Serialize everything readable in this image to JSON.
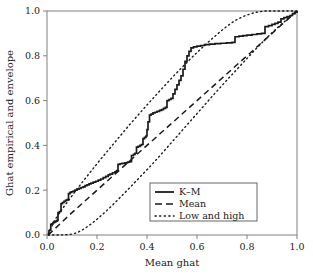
{
  "chart_data": {
    "type": "line",
    "title": "",
    "xlabel": "Mean ghat",
    "ylabel": "Ghat empirical and envelope",
    "xlim": [
      0.0,
      1.0
    ],
    "ylim": [
      0.0,
      1.0
    ],
    "grid": false,
    "legend_position": "bottom-right",
    "xticks": [
      "0.0",
      "0.2",
      "0.4",
      "0.6",
      "0.8",
      "1.0"
    ],
    "xtick_values": [
      0.0,
      0.2,
      0.4,
      0.6,
      0.8,
      1.0
    ],
    "yticks": [
      "0.0",
      "0.2",
      "0.4",
      "0.6",
      "0.8",
      "1.0"
    ],
    "ytick_values": [
      0.0,
      0.2,
      0.4,
      0.6,
      0.8,
      1.0
    ],
    "series": [
      {
        "name": "K-M",
        "style": "solid",
        "shape": "step",
        "points": [
          [
            0.005,
            0.0
          ],
          [
            0.008,
            0.02
          ],
          [
            0.012,
            0.022
          ],
          [
            0.015,
            0.048
          ],
          [
            0.02,
            0.05
          ],
          [
            0.024,
            0.055
          ],
          [
            0.03,
            0.058
          ],
          [
            0.035,
            0.062
          ],
          [
            0.04,
            0.065
          ],
          [
            0.044,
            0.1
          ],
          [
            0.05,
            0.105
          ],
          [
            0.056,
            0.14
          ],
          [
            0.062,
            0.145
          ],
          [
            0.068,
            0.15
          ],
          [
            0.074,
            0.155
          ],
          [
            0.08,
            0.158
          ],
          [
            0.086,
            0.185
          ],
          [
            0.092,
            0.19
          ],
          [
            0.098,
            0.193
          ],
          [
            0.105,
            0.196
          ],
          [
            0.112,
            0.2
          ],
          [
            0.12,
            0.205
          ],
          [
            0.128,
            0.208
          ],
          [
            0.136,
            0.212
          ],
          [
            0.145,
            0.215
          ],
          [
            0.152,
            0.22
          ],
          [
            0.16,
            0.224
          ],
          [
            0.168,
            0.228
          ],
          [
            0.176,
            0.232
          ],
          [
            0.185,
            0.236
          ],
          [
            0.195,
            0.24
          ],
          [
            0.205,
            0.245
          ],
          [
            0.215,
            0.25
          ],
          [
            0.225,
            0.256
          ],
          [
            0.235,
            0.262
          ],
          [
            0.245,
            0.268
          ],
          [
            0.252,
            0.272
          ],
          [
            0.262,
            0.278
          ],
          [
            0.272,
            0.282
          ],
          [
            0.278,
            0.288
          ],
          [
            0.284,
            0.315
          ],
          [
            0.292,
            0.318
          ],
          [
            0.3,
            0.32
          ],
          [
            0.312,
            0.322
          ],
          [
            0.322,
            0.325
          ],
          [
            0.33,
            0.328
          ],
          [
            0.338,
            0.355
          ],
          [
            0.346,
            0.36
          ],
          [
            0.352,
            0.365
          ],
          [
            0.358,
            0.392
          ],
          [
            0.365,
            0.396
          ],
          [
            0.372,
            0.4
          ],
          [
            0.378,
            0.404
          ],
          [
            0.384,
            0.43
          ],
          [
            0.39,
            0.436
          ],
          [
            0.396,
            0.442
          ],
          [
            0.4,
            0.47
          ],
          [
            0.404,
            0.505
          ],
          [
            0.41,
            0.535
          ],
          [
            0.416,
            0.54
          ],
          [
            0.424,
            0.545
          ],
          [
            0.432,
            0.548
          ],
          [
            0.44,
            0.552
          ],
          [
            0.45,
            0.556
          ],
          [
            0.458,
            0.56
          ],
          [
            0.466,
            0.565
          ],
          [
            0.474,
            0.57
          ],
          [
            0.48,
            0.6
          ],
          [
            0.488,
            0.605
          ],
          [
            0.496,
            0.61
          ],
          [
            0.504,
            0.63
          ],
          [
            0.512,
            0.65
          ],
          [
            0.52,
            0.67
          ],
          [
            0.528,
            0.69
          ],
          [
            0.536,
            0.71
          ],
          [
            0.544,
            0.74
          ],
          [
            0.552,
            0.775
          ],
          [
            0.56,
            0.8
          ],
          [
            0.568,
            0.82
          ],
          [
            0.576,
            0.835
          ],
          [
            0.586,
            0.84
          ],
          [
            0.6,
            0.843
          ],
          [
            0.615,
            0.846
          ],
          [
            0.63,
            0.85
          ],
          [
            0.65,
            0.852
          ],
          [
            0.672,
            0.854
          ],
          [
            0.695,
            0.856
          ],
          [
            0.718,
            0.858
          ],
          [
            0.74,
            0.86
          ],
          [
            0.752,
            0.885
          ],
          [
            0.768,
            0.888
          ],
          [
            0.784,
            0.89
          ],
          [
            0.8,
            0.892
          ],
          [
            0.82,
            0.895
          ],
          [
            0.84,
            0.898
          ],
          [
            0.858,
            0.9
          ],
          [
            0.872,
            0.93
          ],
          [
            0.886,
            0.935
          ],
          [
            0.9,
            0.94
          ],
          [
            0.912,
            0.945
          ],
          [
            0.924,
            0.95
          ],
          [
            0.936,
            0.965
          ],
          [
            0.948,
            0.97
          ],
          [
            0.96,
            0.975
          ],
          [
            0.972,
            0.98
          ],
          [
            0.982,
            0.988
          ],
          [
            0.992,
            0.995
          ],
          [
            1.0,
            1.0
          ]
        ]
      },
      {
        "name": "Mean",
        "style": "dashed",
        "shape": "line",
        "points": [
          [
            0.005,
            0.0
          ],
          [
            0.1,
            0.1
          ],
          [
            0.2,
            0.2
          ],
          [
            0.3,
            0.3
          ],
          [
            0.4,
            0.4
          ],
          [
            0.5,
            0.5
          ],
          [
            0.6,
            0.6
          ],
          [
            0.7,
            0.7
          ],
          [
            0.8,
            0.8
          ],
          [
            0.9,
            0.9
          ],
          [
            1.0,
            1.0
          ]
        ]
      },
      {
        "name": "High",
        "style": "dotted",
        "shape": "line",
        "points": [
          [
            0.005,
            0.005
          ],
          [
            0.03,
            0.065
          ],
          [
            0.06,
            0.115
          ],
          [
            0.09,
            0.16
          ],
          [
            0.12,
            0.205
          ],
          [
            0.15,
            0.248
          ],
          [
            0.18,
            0.29
          ],
          [
            0.21,
            0.332
          ],
          [
            0.24,
            0.372
          ],
          [
            0.27,
            0.412
          ],
          [
            0.3,
            0.452
          ],
          [
            0.33,
            0.492
          ],
          [
            0.36,
            0.53
          ],
          [
            0.39,
            0.568
          ],
          [
            0.42,
            0.605
          ],
          [
            0.45,
            0.642
          ],
          [
            0.48,
            0.678
          ],
          [
            0.51,
            0.714
          ],
          [
            0.54,
            0.748
          ],
          [
            0.57,
            0.782
          ],
          [
            0.6,
            0.815
          ],
          [
            0.63,
            0.846
          ],
          [
            0.66,
            0.876
          ],
          [
            0.69,
            0.905
          ],
          [
            0.72,
            0.932
          ],
          [
            0.75,
            0.956
          ],
          [
            0.79,
            0.978
          ],
          [
            0.83,
            0.993
          ],
          [
            0.87,
            1.0
          ],
          [
            0.93,
            1.0
          ],
          [
            1.0,
            1.0
          ]
        ]
      },
      {
        "name": "Low",
        "style": "dotted",
        "shape": "line",
        "points": [
          [
            0.005,
            0.0
          ],
          [
            0.05,
            0.0
          ],
          [
            0.09,
            0.002
          ],
          [
            0.12,
            0.01
          ],
          [
            0.15,
            0.028
          ],
          [
            0.18,
            0.052
          ],
          [
            0.21,
            0.08
          ],
          [
            0.24,
            0.11
          ],
          [
            0.27,
            0.142
          ],
          [
            0.3,
            0.176
          ],
          [
            0.33,
            0.21
          ],
          [
            0.36,
            0.245
          ],
          [
            0.39,
            0.28
          ],
          [
            0.42,
            0.315
          ],
          [
            0.45,
            0.352
          ],
          [
            0.48,
            0.39
          ],
          [
            0.51,
            0.428
          ],
          [
            0.54,
            0.466
          ],
          [
            0.57,
            0.504
          ],
          [
            0.6,
            0.542
          ],
          [
            0.63,
            0.58
          ],
          [
            0.66,
            0.618
          ],
          [
            0.69,
            0.655
          ],
          [
            0.72,
            0.692
          ],
          [
            0.75,
            0.728
          ],
          [
            0.78,
            0.764
          ],
          [
            0.81,
            0.8
          ],
          [
            0.84,
            0.836
          ],
          [
            0.87,
            0.87
          ],
          [
            0.9,
            0.903
          ],
          [
            0.93,
            0.934
          ],
          [
            0.96,
            0.962
          ],
          [
            0.98,
            0.982
          ],
          [
            1.0,
            1.0
          ]
        ]
      }
    ],
    "legend": [
      {
        "label": "K–M",
        "style": "solid"
      },
      {
        "label": "Mean",
        "style": "dashed"
      },
      {
        "label": "Low and high",
        "style": "dotted"
      }
    ]
  }
}
